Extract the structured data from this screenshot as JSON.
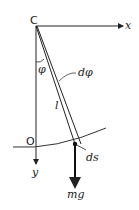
{
  "diagram": {
    "labels": {
      "origin_top": "C",
      "x_axis": "x",
      "y_axis": "y",
      "origin_bottom": "O",
      "angle": "φ",
      "d_angle": "dφ",
      "length": "l",
      "arc_element": "ds",
      "weight": "mg"
    },
    "colors": {
      "line": "#222222",
      "background": "#ffffff"
    }
  }
}
